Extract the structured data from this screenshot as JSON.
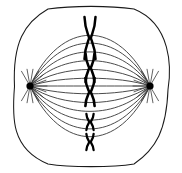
{
  "figure": {
    "stage_label": "Metaphase",
    "canvas": {
      "width": 182,
      "height": 173
    },
    "background_color": "#ffffff"
  },
  "colors": {
    "membrane_stroke": "#1a1a1a",
    "spindle_stroke": "#2b2b2b",
    "astral_stroke": "#3a3a3a",
    "chromosome_stroke": "#000000",
    "centrosome_fill": "#000000",
    "cytoplasm_fill": "#ffffff"
  },
  "cell_membrane": {
    "shape": "rounded-square",
    "bounds": {
      "x": 14,
      "y": 9,
      "width": 154,
      "height": 155
    },
    "corner_radius": 34,
    "stroke_width": 1.05
  },
  "poles": [
    {
      "name": "left-centrosome",
      "cx": 30,
      "cy": 86,
      "r": 3.6
    },
    {
      "name": "right-centrosome",
      "cx": 150,
      "cy": 86,
      "r": 3.6
    }
  ],
  "astral_rays": {
    "count_per_pole": 13,
    "length": 17,
    "angles_left": [
      -120,
      -100,
      -80,
      -60,
      -40,
      -20,
      0,
      20,
      40,
      60,
      80,
      100,
      120
    ],
    "angles_right": [
      60,
      80,
      100,
      120,
      140,
      160,
      180,
      200,
      220,
      240,
      260,
      280,
      300
    ]
  },
  "spindle_fibers": {
    "count": 13,
    "description": "Microtubule fibers arcing from pole to pole across the metaphase plate",
    "bulge_offsets": [
      -52,
      -44,
      -35,
      -26,
      -17,
      -8,
      0,
      8,
      17,
      26,
      35,
      44,
      52
    ]
  },
  "metaphase_plate": {
    "x": 90,
    "top": 18,
    "bottom": 152,
    "chromosome_count": 5
  },
  "chromosomes": [
    {
      "name": "chromosome-1",
      "cx": 90,
      "cy": 38,
      "half_height": 21,
      "arm_spread": 5.5,
      "waist": 1.6,
      "stroke_width": 2.5,
      "form": "X-shape"
    },
    {
      "name": "chromosome-2",
      "cx": 90,
      "cy": 68,
      "half_height": 14,
      "arm_spread": 4.4,
      "waist": 1.4,
      "stroke_width": 2.6,
      "form": "X-shape"
    },
    {
      "name": "chromosome-3",
      "cx": 90,
      "cy": 92,
      "half_height": 14,
      "arm_spread": 4.6,
      "waist": 1.4,
      "stroke_width": 2.6,
      "form": "X-shape"
    },
    {
      "name": "chromosome-4",
      "cx": 90,
      "cy": 122,
      "half_height": 8,
      "arm_spread": 3.6,
      "waist": 1.2,
      "stroke_width": 2.3,
      "form": "X-shape"
    },
    {
      "name": "chromosome-5",
      "cx": 90,
      "cy": 142,
      "half_height": 8,
      "arm_spread": 3.6,
      "waist": 1.2,
      "stroke_width": 2.3,
      "form": "X-shape"
    }
  ]
}
